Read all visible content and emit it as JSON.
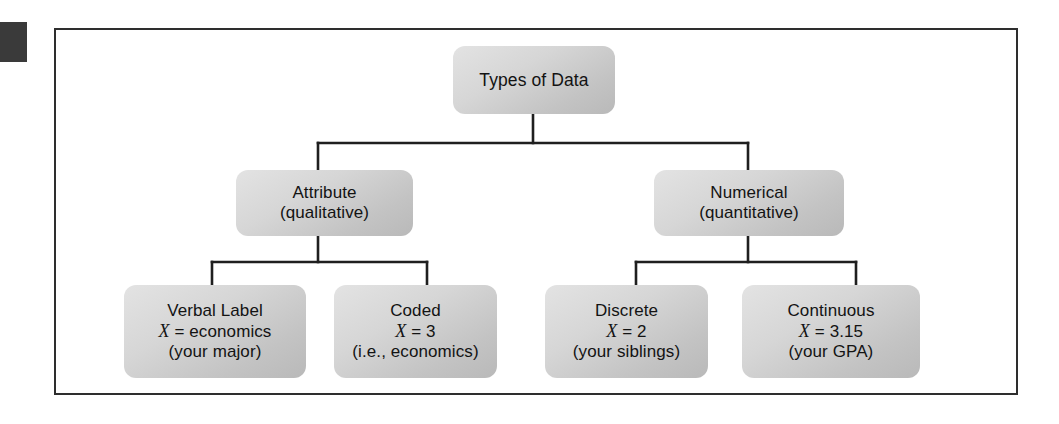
{
  "figure": {
    "type": "hierarchy-tree",
    "title": "Types of Data",
    "levels": 3,
    "frame_border_color": "#2e2e2e",
    "node_fill_color": "#d2d2d2",
    "connector_color": "#1f1f1f"
  },
  "tree": {
    "root": {
      "id": "types-of-data",
      "label": "Types of Data"
    },
    "branches": [
      {
        "id": "attribute",
        "line1": "Attribute",
        "line2": "(qualitative)",
        "children": [
          {
            "id": "verbal-label",
            "line1": "Verbal Label",
            "var_name": "X",
            "var_equals": "=",
            "var_value": "economics",
            "line3": "(your major)"
          },
          {
            "id": "coded",
            "line1": "Coded",
            "var_name": "X",
            "var_equals": "=",
            "var_value": "3",
            "line3": "(i.e., economics)"
          }
        ]
      },
      {
        "id": "numerical",
        "line1": "Numerical",
        "line2": "(quantitative)",
        "children": [
          {
            "id": "discrete",
            "line1": "Discrete",
            "var_name": "X",
            "var_equals": "=",
            "var_value": "2",
            "line3": "(your siblings)"
          },
          {
            "id": "continuous",
            "line1": "Continuous",
            "var_name": "X",
            "var_equals": "=",
            "var_value": "3.15",
            "line3": "(your GPA)"
          }
        ]
      }
    ]
  }
}
